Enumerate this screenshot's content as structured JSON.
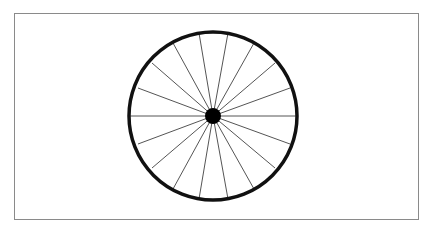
{
  "diagram": {
    "frame": {
      "x": 14,
      "y": 13,
      "width": 405,
      "height": 207,
      "stroke": "#8a8a8a"
    },
    "wheel": {
      "center": [
        213,
        116
      ],
      "rim_radius": 84,
      "rim_stroke_width": 3.5,
      "rim_color": "#111111",
      "hub_radius": 8,
      "hub_color": "#000000",
      "spoke_color": "#555555",
      "spoke_count": 18,
      "spoke_endpoints": [
        [
          199,
          33
        ],
        [
          228,
          33
        ],
        [
          173,
          43
        ],
        [
          254,
          43
        ],
        [
          152,
          63
        ],
        [
          275,
          63
        ],
        [
          138,
          88
        ],
        [
          290,
          88
        ],
        [
          130,
          116
        ],
        [
          297,
          116
        ],
        [
          138,
          144
        ],
        [
          290,
          144
        ],
        [
          152,
          168
        ],
        [
          275,
          168
        ],
        [
          173,
          189
        ],
        [
          254,
          189
        ],
        [
          199,
          199
        ],
        [
          228,
          199
        ]
      ]
    }
  }
}
